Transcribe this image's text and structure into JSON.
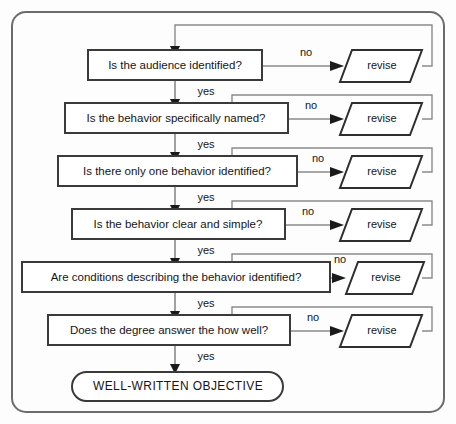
{
  "diagram": {
    "frame": {
      "border_color": "#6b6b6b",
      "background": "#fdfdfd"
    },
    "colors": {
      "box_stroke": "#3a3a3a",
      "edge_stroke": "#8a8a8a",
      "arrow_fill": "#1a1a1a",
      "text": "#151515",
      "node_fill": "#ffffff"
    },
    "decisions": [
      {
        "id": "d1",
        "label": "Is the audience identified?",
        "yes_label": "yes",
        "no_label": "no",
        "revise_label": "revise"
      },
      {
        "id": "d2",
        "label": "Is the behavior specifically named?",
        "yes_label": "yes",
        "no_label": "no",
        "revise_label": "revise"
      },
      {
        "id": "d3",
        "label": "Is there only one behavior identified?",
        "yes_label": "yes",
        "no_label": "no",
        "revise_label": "revise"
      },
      {
        "id": "d4",
        "label": "Is the behavior clear and simple?",
        "yes_label": "yes",
        "no_label": "no",
        "revise_label": "revise"
      },
      {
        "id": "d5",
        "label": "Are conditions describing the behavior identified?",
        "yes_label": "yes",
        "no_label": "no",
        "revise_label": "revise"
      },
      {
        "id": "d6",
        "label": "Does the degree answer the  how well?",
        "yes_label": "yes",
        "no_label": "no",
        "revise_label": "revise"
      }
    ],
    "terminal": {
      "id": "t1",
      "label": "WELL-WRITTEN  OBJECTIVE"
    }
  }
}
